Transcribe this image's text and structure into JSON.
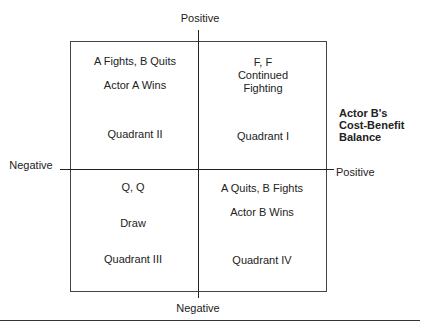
{
  "axes": {
    "vertical_top": "Positive",
    "vertical_bottom": "Negative",
    "horizontal_left": "Negative",
    "horizontal_right": "Positive",
    "side_label": [
      "Actor B's",
      "Cost-Benefit",
      "Balance"
    ]
  },
  "quadrants": {
    "q2": {
      "outcome": "A Fights, B Quits",
      "result": "Actor A Wins",
      "name": "Quadrant II"
    },
    "q1": {
      "outcome": "F, F",
      "result_line1": "Continued",
      "result_line2": "Fighting",
      "name": "Quadrant I"
    },
    "q3": {
      "outcome": "Q, Q",
      "result": "Draw",
      "name": "Quadrant III"
    },
    "q4": {
      "outcome": "A Quits, B Fights",
      "result": "Actor B Wins",
      "name": "Quadrant IV"
    }
  }
}
